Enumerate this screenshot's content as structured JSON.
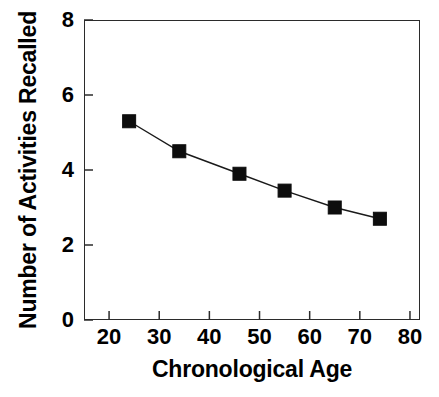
{
  "chart_data": {
    "type": "line",
    "title": "",
    "xlabel": "Chronological Age",
    "ylabel": "Number of Activities Recalled",
    "xlim": [
      15,
      82
    ],
    "ylim": [
      0,
      8
    ],
    "xticks": [
      20,
      30,
      40,
      50,
      60,
      70,
      80
    ],
    "xtick_labels": [
      "20",
      "30",
      "40",
      "50",
      "60",
      "70",
      "80"
    ],
    "yticks": [
      0,
      2,
      4,
      6,
      8
    ],
    "ytick_labels": [
      "0",
      "2",
      "4",
      "6",
      "8"
    ],
    "grid": false,
    "legend": false,
    "marker": "filled-square",
    "marker_color": "#0d0d0d",
    "line_color": "#1a1a1a",
    "x": [
      24,
      34,
      46,
      55,
      65,
      74
    ],
    "values": [
      5.3,
      4.5,
      3.9,
      3.45,
      3.0,
      2.7
    ],
    "series": [
      {
        "name": "Activities recalled by age",
        "x": [
          24,
          34,
          46,
          55,
          65,
          74
        ],
        "values": [
          5.3,
          4.5,
          3.9,
          3.45,
          3.0,
          2.7
        ]
      }
    ]
  }
}
